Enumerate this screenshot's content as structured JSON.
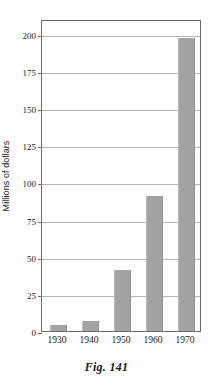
{
  "figure": {
    "caption": "Fig. 141"
  },
  "chart_data": {
    "type": "bar",
    "title": "",
    "subtitle": "",
    "xlabel": "",
    "ylabel": "Millions of dollars",
    "categories": [
      "1930",
      "1940",
      "1950",
      "1960",
      "1970"
    ],
    "values": [
      4,
      7,
      41,
      91,
      197
    ],
    "series": [
      {
        "name": "Millions of dollars",
        "values": [
          4,
          7,
          41,
          91,
          197
        ]
      }
    ],
    "ylim": [
      0,
      210
    ],
    "yticks": [
      0,
      25,
      50,
      75,
      100,
      125,
      150,
      175,
      200
    ],
    "ytick_labels": [
      "0",
      "25",
      "50",
      "75",
      "100",
      "125",
      "150",
      "175",
      "200"
    ],
    "grid": "horizontal",
    "legend": "none",
    "annotations": [],
    "colors": {
      "bar_fill": "#a3a3a3",
      "frame": "#6b6b6b",
      "gridline": "#b4b4b4",
      "text": "#1a1a1a",
      "background": "#ffffff"
    }
  }
}
